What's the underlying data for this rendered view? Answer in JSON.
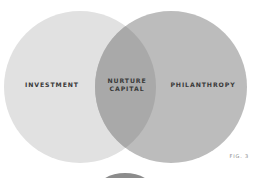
{
  "diagram": {
    "type": "venn",
    "colors": {
      "left_circle": "#e1e1e1",
      "right_circle": "#bcbcbc",
      "overlap": "#a9a9a9",
      "label_text": "#3a3a3a",
      "fig_text": "#8a8a8a",
      "partial_shape_bottom": "#8c8c8c"
    },
    "sets": [
      {
        "id": "left",
        "label": "INVESTMENT"
      },
      {
        "id": "right",
        "label": "PHILANTHROPY"
      }
    ],
    "intersection": {
      "line1": "NURTURE",
      "line2": "CAPITAL"
    },
    "figure_label": "FIG. 3"
  }
}
